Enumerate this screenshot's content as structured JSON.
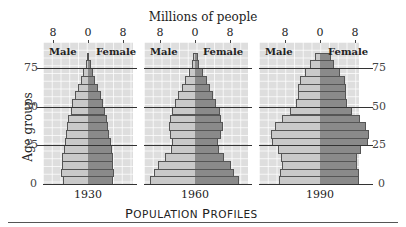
{
  "chart_data": {
    "type": "bar",
    "subtype": "population-pyramid",
    "title": "Population Profiles",
    "xlabel": "Millions of people",
    "ylabel": "Age groups",
    "x_ticks": [
      "8",
      "0",
      "8"
    ],
    "y_ticks": [
      "0",
      "25",
      "50",
      "75"
    ],
    "xlim": [
      -10,
      10
    ],
    "ylim": [
      0,
      90
    ],
    "age_groups": [
      "0-4",
      "5-9",
      "10-14",
      "15-19",
      "20-24",
      "25-29",
      "30-34",
      "35-39",
      "40-44",
      "45-49",
      "50-54",
      "55-59",
      "60-64",
      "65-69",
      "70-74",
      "75-79",
      "80+"
    ],
    "legend": [
      "Male",
      "Female"
    ],
    "panels": [
      {
        "year": "1930",
        "male": [
          5.8,
          6.2,
          6.0,
          5.9,
          5.5,
          5.3,
          5.0,
          4.8,
          4.5,
          4.0,
          3.6,
          3.0,
          2.3,
          1.7,
          1.1,
          0.5,
          0.2
        ],
        "female": [
          5.6,
          6.0,
          5.8,
          5.7,
          5.4,
          5.2,
          4.9,
          4.6,
          4.3,
          3.9,
          3.4,
          2.9,
          2.3,
          1.7,
          1.2,
          0.6,
          0.2
        ]
      },
      {
        "year": "1960",
        "male": [
          10.3,
          9.3,
          8.4,
          6.8,
          5.5,
          5.2,
          5.7,
          6.0,
          5.7,
          5.3,
          4.6,
          3.8,
          3.0,
          2.3,
          1.3,
          0.8,
          0.4
        ],
        "female": [
          10.0,
          9.0,
          8.2,
          6.7,
          5.5,
          5.3,
          5.9,
          6.3,
          6.0,
          5.6,
          4.9,
          4.2,
          3.5,
          2.7,
          1.8,
          1.0,
          0.6
        ]
      },
      {
        "year": "1990",
        "male": [
          9.4,
          9.2,
          8.8,
          8.9,
          9.6,
          11.0,
          11.2,
          10.2,
          8.8,
          6.8,
          5.5,
          5.1,
          5.0,
          4.5,
          3.5,
          2.3,
          1.2
        ],
        "female": [
          9.0,
          8.8,
          8.4,
          8.5,
          9.3,
          10.9,
          11.2,
          10.4,
          9.2,
          7.3,
          6.1,
          5.9,
          6.0,
          5.6,
          4.6,
          3.3,
          2.4
        ]
      }
    ]
  },
  "labels": {
    "top_title": "Millions of people",
    "y_axis": "Age groups",
    "male": "Male",
    "female": "Female",
    "tick_8": "8",
    "tick_0": "0",
    "ages": [
      "0",
      "25",
      "50",
      "75"
    ],
    "footer_first_P": "P",
    "footer_rest_1": "OPULATION ",
    "footer_second_P": "P",
    "footer_rest_2": "ROFILES"
  },
  "colors": {
    "male_bar": "#c9c9c9",
    "female_bar": "#8a8a8a",
    "panel_bg": "#dedede",
    "gridline": "#333333"
  }
}
